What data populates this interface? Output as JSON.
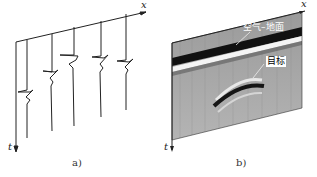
{
  "panel_a": {
    "x_axis_label": "x",
    "t_axis_label": "t",
    "caption": "a)",
    "traces": 5
  },
  "panel_b": {
    "x_axis_label": "x",
    "t_axis_label": "t",
    "caption": "b)",
    "annotation_surface": "空气–地面",
    "annotation_target": "目标"
  }
}
